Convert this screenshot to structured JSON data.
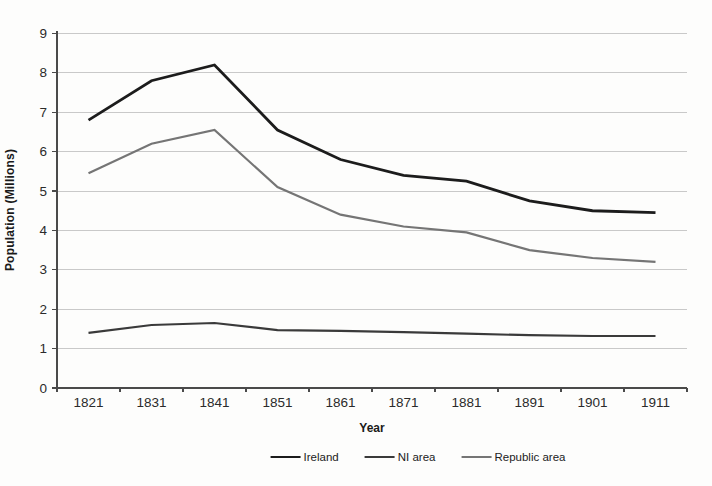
{
  "figure": {
    "background_color": "#fdfdfc"
  },
  "chart_data": {
    "type": "line",
    "title": "",
    "xlabel": "Year",
    "ylabel": "Population (Millions)",
    "categories": [
      "1821",
      "1831",
      "1841",
      "1851",
      "1861",
      "1871",
      "1881",
      "1891",
      "1901",
      "1911"
    ],
    "ylim": [
      0,
      9
    ],
    "yticks": [
      0,
      1,
      2,
      3,
      4,
      5,
      6,
      7,
      8,
      9
    ],
    "grid": "horizontal",
    "legend_position": "bottom-center",
    "axis_color": "#4a4a4a",
    "gridline_color": "#c9c9c9",
    "tick_label_color": "#2b2b2b",
    "series": [
      {
        "name": "Ireland",
        "color": "#1c1c1c",
        "line_width": 2.8,
        "values": [
          6.8,
          7.8,
          8.2,
          6.55,
          5.8,
          5.4,
          5.25,
          4.75,
          4.5,
          4.45
        ]
      },
      {
        "name": "NI area",
        "color": "#3a3a3a",
        "line_width": 2.2,
        "values": [
          1.4,
          1.6,
          1.65,
          1.47,
          1.45,
          1.42,
          1.38,
          1.34,
          1.32,
          1.32
        ]
      },
      {
        "name": "Republic area",
        "color": "#757575",
        "line_width": 2.2,
        "values": [
          5.45,
          6.2,
          6.55,
          5.1,
          4.4,
          4.1,
          3.95,
          3.5,
          3.3,
          3.2
        ]
      }
    ]
  }
}
